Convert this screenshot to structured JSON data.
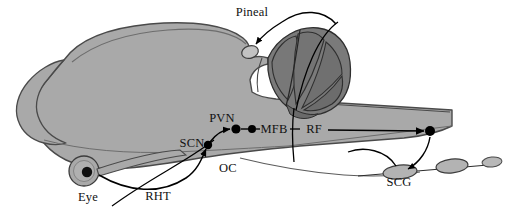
{
  "figure": {
    "type": "anatomical-diagram",
    "background_color": "#ffffff",
    "width": 514,
    "height": 209
  },
  "palette": {
    "brain_fill": "#a9a9a9",
    "brain_stroke": "#4a4a4a",
    "cerebellum_fill": "#7a7a7a",
    "cerebellum_stroke": "#2f2f2f",
    "pineal_fill": "#c2c2c2",
    "ganglion_fill": "#b3b3b3",
    "eye_fill": "#a9a9a9",
    "pupil_fill": "#111111",
    "nucleus_dot": "#000000",
    "pathway_stroke": "#000000",
    "label_text": "#111111"
  },
  "labels": [
    {
      "id": "pineal",
      "text": "Pineal",
      "x": 252,
      "y": 16,
      "anchor": "middle",
      "note": "pineal gland, melatonin output"
    },
    {
      "id": "pvn",
      "text": "PVN",
      "x": 222,
      "y": 122,
      "anchor": "middle",
      "note": "paraventricular nucleus"
    },
    {
      "id": "mfb",
      "text": "MFB",
      "x": 274,
      "y": 130,
      "anchor": "middle",
      "note": "medial forebrain bundle"
    },
    {
      "id": "rf",
      "text": "RF",
      "x": 314,
      "y": 130,
      "anchor": "middle",
      "note": "reticular formation"
    },
    {
      "id": "scn",
      "text": "SCN",
      "x": 192,
      "y": 145,
      "anchor": "middle",
      "note": "suprachiasmatic nucleus"
    },
    {
      "id": "oc",
      "text": "OC",
      "x": 228,
      "y": 170,
      "anchor": "middle",
      "note": "optic chiasm"
    },
    {
      "id": "eye",
      "text": "Eye",
      "x": 88,
      "y": 200,
      "anchor": "middle",
      "note": "retina, photoreceptive input"
    },
    {
      "id": "rht",
      "text": "RHT",
      "x": 158,
      "y": 199,
      "anchor": "middle",
      "note": "retinohypothalamic tract"
    },
    {
      "id": "scg",
      "text": "SCG",
      "x": 399,
      "y": 184,
      "anchor": "middle",
      "note": "superior cervical ganglion"
    }
  ],
  "nodes": [
    {
      "id": "eye-pupil",
      "label": "Eye",
      "cx": 87,
      "cy": 172,
      "r": 5.2
    },
    {
      "id": "scn-dot",
      "label": "SCN",
      "cx": 208,
      "cy": 145,
      "r": 4.2
    },
    {
      "id": "pvn-dot",
      "label": "PVN",
      "cx": 236,
      "cy": 129,
      "r": 4.6
    },
    {
      "id": "mfb-dot",
      "label": "MFB",
      "cx": 252,
      "cy": 129,
      "r": 4.0
    },
    {
      "id": "iml-dot",
      "label": "IML",
      "cx": 430,
      "cy": 131,
      "r": 5.0
    }
  ],
  "pathway": {
    "sequence": [
      "Eye",
      "RHT",
      "SCN",
      "PVN",
      "MFB",
      "RF",
      "IML",
      "SCG",
      "Pineal"
    ],
    "direction": "eye-to-pineal"
  },
  "structures": [
    {
      "id": "cerebrum",
      "name": "cerebral cortex"
    },
    {
      "id": "olfactory",
      "name": "olfactory bulb"
    },
    {
      "id": "cerebellum",
      "name": "cerebellum"
    },
    {
      "id": "brainstem",
      "name": "brainstem and spinal cord"
    },
    {
      "id": "pineal-body",
      "name": "pineal gland"
    },
    {
      "id": "scg-body",
      "name": "superior cervical ganglion"
    },
    {
      "id": "ganglion-2",
      "name": "sympathetic chain ganglion"
    },
    {
      "id": "eye-globe",
      "name": "eye globe"
    }
  ]
}
